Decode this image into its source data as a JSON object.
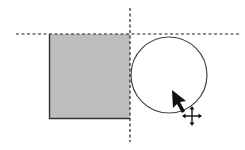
{
  "canvas": {
    "width": 245,
    "height": 150,
    "background": "#ffffff"
  },
  "guides": {
    "horizontal": {
      "y": 34,
      "x1": 16,
      "x2": 240,
      "color": "#222222",
      "style": "dashed"
    },
    "vertical": {
      "x": 130,
      "y1": 8,
      "y2": 142,
      "color": "#222222",
      "style": "dashed"
    }
  },
  "shapes": {
    "square": {
      "x": 49,
      "y": 34,
      "width": 81,
      "height": 84,
      "fill": "#bdbdbd",
      "stroke": "#333333"
    },
    "circle": {
      "cx": 169,
      "cy": 75,
      "r": 38,
      "fill": "#ffffff",
      "stroke": "#444444"
    }
  },
  "cursor": {
    "arrow": {
      "x": 172,
      "y": 90,
      "color": "#111111"
    },
    "move_icon": {
      "x": 192,
      "y": 116,
      "color": "#111111"
    }
  }
}
